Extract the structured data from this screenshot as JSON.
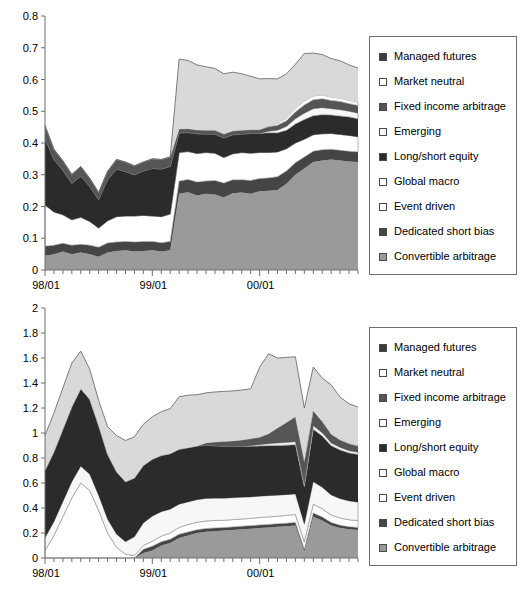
{
  "figure": {
    "background": "#ffffff",
    "series_colors": {
      "managed_futures": "#3a3a3a",
      "market_neutral": "#ffffff",
      "fixed_income_arbitrage": "#555555",
      "emerging": "#f2f2f2",
      "long_short_equity": "#2b2b2b",
      "global_macro": "#ffffff",
      "event_driven": "#ffffff",
      "dedicated_short_bias": "#454545",
      "convertible_arbitrage": "#9a9a9a",
      "light_band": "#d9d9d9",
      "outline": "#6e6e6e"
    }
  },
  "legend": {
    "items": [
      {
        "label": "Managed futures",
        "color": "#3a3a3a",
        "key": "managed_futures"
      },
      {
        "label": "Market neutral",
        "color": "#ffffff",
        "key": "market_neutral"
      },
      {
        "label": "Fixed income arbitrage",
        "color": "#555555",
        "key": "fixed_income_arbitrage"
      },
      {
        "label": "Emerging",
        "color": "#f7f7f7",
        "key": "emerging"
      },
      {
        "label": "Long/short equity",
        "color": "#2b2b2b",
        "key": "long_short_equity"
      },
      {
        "label": "Global macro",
        "color": "#ffffff",
        "key": "global_macro"
      },
      {
        "label": "Event driven",
        "color": "#ffffff",
        "key": "event_driven"
      },
      {
        "label": "Dedicated short bias",
        "color": "#454545",
        "key": "dedicated_short_bias"
      },
      {
        "label": "Convertible arbitrage",
        "color": "#9a9a9a",
        "key": "convertible_arbitrage"
      }
    ]
  },
  "chart_data": [
    {
      "id": "top",
      "type": "area",
      "stacked": true,
      "title": "",
      "xlabel": "",
      "ylabel": "",
      "ylim": [
        0,
        0.8
      ],
      "ytick_labels": [
        "0",
        "0.1",
        "0.2",
        "0.3",
        "0.4",
        "0.5",
        "0.6",
        "0.7",
        "0.8"
      ],
      "ytick_values": [
        0,
        0.1,
        0.2,
        0.3,
        0.4,
        0.5,
        0.6,
        0.7,
        0.8
      ],
      "grid": false,
      "legend_position": "right",
      "xtick_labels": [
        "98/01",
        "99/01",
        "00/01"
      ],
      "xtick_positions": [
        0,
        12,
        24
      ],
      "x": [
        0,
        1,
        2,
        3,
        4,
        5,
        6,
        7,
        8,
        9,
        10,
        11,
        12,
        13,
        14,
        15,
        16,
        17,
        18,
        19,
        20,
        21,
        22,
        23,
        24,
        25,
        26,
        27,
        28,
        29,
        30,
        31,
        32,
        33,
        34,
        35
      ],
      "x_minor_ticks": 36,
      "series": [
        {
          "name": "Convertible arbitrage",
          "color": "#9a9a9a",
          "values": [
            0.045,
            0.05,
            0.058,
            0.05,
            0.055,
            0.05,
            0.042,
            0.055,
            0.06,
            0.062,
            0.058,
            0.06,
            0.062,
            0.058,
            0.062,
            0.24,
            0.245,
            0.235,
            0.24,
            0.238,
            0.228,
            0.242,
            0.244,
            0.24,
            0.248,
            0.25,
            0.252,
            0.272,
            0.3,
            0.32,
            0.34,
            0.345,
            0.348,
            0.345,
            0.342,
            0.34
          ]
        },
        {
          "name": "Dedicated short bias",
          "color": "#454545",
          "values": [
            0.03,
            0.028,
            0.026,
            0.028,
            0.026,
            0.028,
            0.03,
            0.03,
            0.028,
            0.028,
            0.03,
            0.03,
            0.028,
            0.028,
            0.028,
            0.04,
            0.04,
            0.042,
            0.04,
            0.044,
            0.046,
            0.042,
            0.04,
            0.042,
            0.04,
            0.04,
            0.042,
            0.04,
            0.038,
            0.036,
            0.034,
            0.034,
            0.032,
            0.032,
            0.032,
            0.032
          ]
        },
        {
          "name": "Event driven",
          "color": "#ffffff",
          "values": [
            0.13,
            0.105,
            0.09,
            0.08,
            0.085,
            0.075,
            0.06,
            0.07,
            0.08,
            0.08,
            0.082,
            0.082,
            0.08,
            0.082,
            0.086,
            0.09,
            0.088,
            0.09,
            0.09,
            0.086,
            0.08,
            0.082,
            0.086,
            0.086,
            0.082,
            0.08,
            0.078,
            0.07,
            0.062,
            0.056,
            0.052,
            0.05,
            0.05,
            0.05,
            0.05,
            0.048
          ]
        },
        {
          "name": "Global macro",
          "color": "#ffffff",
          "values": [
            0.0,
            0.0,
            0.0,
            0.0,
            0.0,
            0.0,
            0.0,
            0.0,
            0.0,
            0.0,
            0.0,
            0.0,
            0.0,
            0.0,
            0.0,
            0.0,
            0.0,
            0.0,
            0.0,
            0.0,
            0.0,
            0.0,
            0.0,
            0.0,
            0.0,
            0.0,
            0.0,
            0.0,
            0.0,
            0.0,
            0.0,
            0.0,
            0.0,
            0.0,
            0.0,
            0.0
          ]
        },
        {
          "name": "Long/short equity",
          "color": "#2b2b2b",
          "values": [
            0.21,
            0.165,
            0.14,
            0.115,
            0.13,
            0.11,
            0.09,
            0.13,
            0.15,
            0.14,
            0.13,
            0.14,
            0.15,
            0.15,
            0.15,
            0.062,
            0.06,
            0.062,
            0.058,
            0.06,
            0.062,
            0.06,
            0.058,
            0.062,
            0.06,
            0.062,
            0.06,
            0.058,
            0.06,
            0.062,
            0.06,
            0.06,
            0.058,
            0.058,
            0.058,
            0.056
          ]
        },
        {
          "name": "Emerging",
          "color": "#f7f7f7",
          "values": [
            0.0,
            0.0,
            0.0,
            0.0,
            0.0,
            0.0,
            0.0,
            0.0,
            0.0,
            0.0,
            0.0,
            0.0,
            0.0,
            0.0,
            0.0,
            0.0,
            0.0,
            0.0,
            0.0,
            0.0,
            0.0,
            0.0,
            0.0,
            0.0,
            0.0,
            0.005,
            0.008,
            0.012,
            0.016,
            0.02,
            0.022,
            0.022,
            0.02,
            0.02,
            0.018,
            0.018
          ]
        },
        {
          "name": "Fixed income arbitrage",
          "color": "#555555",
          "values": [
            0.04,
            0.032,
            0.03,
            0.028,
            0.03,
            0.026,
            0.022,
            0.026,
            0.03,
            0.03,
            0.028,
            0.028,
            0.03,
            0.03,
            0.03,
            0.012,
            0.012,
            0.012,
            0.012,
            0.012,
            0.012,
            0.012,
            0.012,
            0.012,
            0.012,
            0.014,
            0.016,
            0.018,
            0.022,
            0.026,
            0.028,
            0.028,
            0.026,
            0.026,
            0.024,
            0.024
          ]
        },
        {
          "name": "Market neutral",
          "color": "#ffffff",
          "values": [
            0.0,
            0.0,
            0.0,
            0.0,
            0.0,
            0.0,
            0.0,
            0.0,
            0.0,
            0.0,
            0.0,
            0.0,
            0.0,
            0.0,
            0.0,
            0.0,
            0.0,
            0.0,
            0.0,
            0.0,
            0.0,
            0.0,
            0.0,
            0.0,
            0.0,
            0.004,
            0.006,
            0.008,
            0.01,
            0.012,
            0.012,
            0.012,
            0.01,
            0.01,
            0.01,
            0.01
          ]
        },
        {
          "name": "Managed futures",
          "color": "#d9d9d9",
          "values": [
            0.0,
            0.0,
            0.0,
            0.0,
            0.0,
            0.0,
            0.0,
            0.0,
            0.0,
            0.0,
            0.0,
            0.0,
            0.0,
            0.0,
            0.0,
            0.22,
            0.215,
            0.205,
            0.2,
            0.195,
            0.19,
            0.185,
            0.178,
            0.168,
            0.16,
            0.148,
            0.14,
            0.14,
            0.14,
            0.15,
            0.135,
            0.128,
            0.122,
            0.118,
            0.112,
            0.108
          ]
        }
      ],
      "total_top": [
        0.455,
        0.38,
        0.344,
        0.301,
        0.326,
        0.289,
        0.244,
        0.311,
        0.348,
        0.34,
        0.328,
        0.34,
        0.35,
        0.348,
        0.356,
        0.664,
        0.66,
        0.646,
        0.64,
        0.635,
        0.618,
        0.623,
        0.618,
        0.61,
        0.602,
        0.603,
        0.602,
        0.618,
        0.648,
        0.682,
        0.683,
        0.679,
        0.666,
        0.659,
        0.646,
        0.636
      ]
    },
    {
      "id": "bottom",
      "type": "area",
      "stacked": true,
      "title": "",
      "xlabel": "",
      "ylabel": "",
      "ylim": [
        0,
        2
      ],
      "ytick_labels": [
        "0",
        "0.2",
        "0.4",
        "0.6",
        "0.8",
        "1",
        "1.2",
        "1.4",
        "1.6",
        "1.8",
        "2"
      ],
      "ytick_values": [
        0,
        0.2,
        0.4,
        0.6,
        0.8,
        1.0,
        1.2,
        1.4,
        1.6,
        1.8,
        2.0
      ],
      "grid": false,
      "legend_position": "right",
      "xtick_labels": [
        "98/01",
        "99/01",
        "00/01"
      ],
      "xtick_positions": [
        0,
        12,
        24
      ],
      "x": [
        0,
        1,
        2,
        3,
        4,
        5,
        6,
        7,
        8,
        9,
        10,
        11,
        12,
        13,
        14,
        15,
        16,
        17,
        18,
        19,
        20,
        21,
        22,
        23,
        24,
        25,
        26,
        27,
        28,
        29,
        30,
        31,
        32,
        33,
        34,
        35
      ],
      "x_minor_ticks": 36,
      "series": [
        {
          "name": "Convertible arbitrage",
          "color": "#9a9a9a",
          "values": [
            0.0,
            0.0,
            0.0,
            0.0,
            0.0,
            0.0,
            0.0,
            0.0,
            0.0,
            0.0,
            0.0,
            0.04,
            0.06,
            0.1,
            0.12,
            0.16,
            0.18,
            0.2,
            0.21,
            0.215,
            0.22,
            0.225,
            0.23,
            0.235,
            0.24,
            0.245,
            0.25,
            0.255,
            0.26,
            0.05,
            0.33,
            0.3,
            0.26,
            0.24,
            0.23,
            0.225
          ]
        },
        {
          "name": "Dedicated short bias",
          "color": "#454545",
          "values": [
            0.0,
            0.0,
            0.0,
            0.0,
            0.0,
            0.0,
            0.0,
            0.0,
            0.0,
            0.0,
            0.0,
            0.03,
            0.035,
            0.03,
            0.03,
            0.03,
            0.028,
            0.026,
            0.026,
            0.025,
            0.024,
            0.024,
            0.024,
            0.024,
            0.024,
            0.024,
            0.024,
            0.024,
            0.024,
            0.02,
            0.03,
            0.028,
            0.024,
            0.022,
            0.02,
            0.02
          ]
        },
        {
          "name": "Event driven",
          "color": "#ffffff",
          "values": [
            0.06,
            0.18,
            0.33,
            0.48,
            0.6,
            0.54,
            0.38,
            0.2,
            0.085,
            0.03,
            0.02,
            0.03,
            0.04,
            0.045,
            0.05,
            0.055,
            0.06,
            0.06,
            0.06,
            0.06,
            0.058,
            0.058,
            0.058,
            0.058,
            0.06,
            0.06,
            0.06,
            0.062,
            0.064,
            0.06,
            0.07,
            0.066,
            0.06,
            0.058,
            0.056,
            0.054
          ]
        },
        {
          "name": "Global macro",
          "color": "#f7f7f7",
          "values": [
            0.1,
            0.11,
            0.12,
            0.13,
            0.135,
            0.13,
            0.12,
            0.11,
            0.105,
            0.1,
            0.15,
            0.18,
            0.2,
            0.195,
            0.19,
            0.185,
            0.18,
            0.18,
            0.18,
            0.178,
            0.176,
            0.175,
            0.174,
            0.172,
            0.17,
            0.17,
            0.168,
            0.166,
            0.164,
            0.14,
            0.18,
            0.172,
            0.16,
            0.155,
            0.15,
            0.148
          ]
        },
        {
          "name": "Long/short equity",
          "color": "#2b2b2b",
          "values": [
            0.54,
            0.56,
            0.58,
            0.6,
            0.62,
            0.6,
            0.56,
            0.52,
            0.5,
            0.48,
            0.47,
            0.46,
            0.455,
            0.45,
            0.445,
            0.44,
            0.435,
            0.43,
            0.425,
            0.42,
            0.415,
            0.41,
            0.408,
            0.405,
            0.402,
            0.4,
            0.398,
            0.396,
            0.394,
            0.3,
            0.42,
            0.41,
            0.395,
            0.39,
            0.385,
            0.382
          ]
        },
        {
          "name": "Emerging",
          "color": "#f2f2f2",
          "values": [
            0.0,
            0.0,
            0.0,
            0.0,
            0.0,
            0.0,
            0.0,
            0.0,
            0.0,
            0.0,
            0.0,
            0.0,
            0.0,
            0.0,
            0.0,
            0.0,
            0.0,
            0.0,
            0.0,
            0.0,
            0.0,
            0.0,
            0.0,
            0.005,
            0.01,
            0.015,
            0.02,
            0.022,
            0.024,
            0.02,
            0.028,
            0.026,
            0.022,
            0.02,
            0.018,
            0.018
          ]
        },
        {
          "name": "Fixed income arbitrage",
          "color": "#555555",
          "values": [
            0.0,
            0.0,
            0.0,
            0.0,
            0.0,
            0.0,
            0.0,
            0.0,
            0.0,
            0.0,
            0.0,
            0.0,
            0.0,
            0.0,
            0.0,
            0.0,
            0.0,
            0.0,
            0.02,
            0.03,
            0.04,
            0.045,
            0.05,
            0.055,
            0.06,
            0.08,
            0.12,
            0.16,
            0.2,
            0.18,
            0.12,
            0.09,
            0.07,
            0.06,
            0.055,
            0.05
          ]
        },
        {
          "name": "Market neutral",
          "color": "#ffffff",
          "values": [
            0.0,
            0.0,
            0.0,
            0.0,
            0.0,
            0.0,
            0.0,
            0.0,
            0.0,
            0.0,
            0.0,
            0.0,
            0.0,
            0.0,
            0.0,
            0.0,
            0.0,
            0.0,
            0.0,
            0.0,
            0.0,
            0.0,
            0.0,
            0.0,
            0.0,
            0.0,
            0.0,
            0.0,
            0.0,
            0.01,
            0.02,
            0.018,
            0.014,
            0.012,
            0.01,
            0.01
          ]
        },
        {
          "name": "Managed futures",
          "color": "#d9d9d9",
          "values": [
            0.28,
            0.31,
            0.33,
            0.35,
            0.3,
            0.24,
            0.2,
            0.22,
            0.29,
            0.33,
            0.33,
            0.33,
            0.34,
            0.35,
            0.36,
            0.42,
            0.42,
            0.41,
            0.4,
            0.4,
            0.4,
            0.4,
            0.4,
            0.4,
            0.56,
            0.64,
            0.56,
            0.52,
            0.48,
            0.42,
            0.33,
            0.33,
            0.38,
            0.33,
            0.31,
            0.3
          ]
        }
      ],
      "total_top": [
        0.98,
        1.16,
        1.36,
        1.56,
        1.655,
        1.51,
        1.26,
        1.05,
        0.98,
        0.94,
        0.97,
        1.07,
        1.13,
        1.17,
        1.195,
        1.29,
        1.303,
        1.306,
        1.321,
        1.328,
        1.333,
        1.337,
        1.344,
        1.354,
        1.526,
        1.634,
        1.6,
        1.605,
        1.61,
        1.2,
        1.528,
        1.44,
        1.385,
        1.287,
        1.234,
        1.227
      ]
    }
  ]
}
